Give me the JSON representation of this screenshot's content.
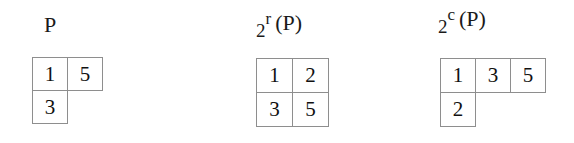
{
  "figure": {
    "background_color": "#ffffff",
    "border_color": "#8e8e8e",
    "text_color": "#1a1a1a"
  },
  "diagrams": [
    {
      "id": "p",
      "label": {
        "base": "P",
        "base_low": "",
        "superscript": "",
        "argument": ""
      },
      "shape": [
        2,
        1
      ],
      "rows": [
        [
          "1",
          "5"
        ],
        [
          "3"
        ]
      ]
    },
    {
      "id": "row",
      "label": {
        "base": "",
        "base_low": "2",
        "superscript": "r",
        "argument": "(P)"
      },
      "shape": [
        2,
        2
      ],
      "rows": [
        [
          "1",
          "2"
        ],
        [
          "3",
          "5"
        ]
      ]
    },
    {
      "id": "col",
      "label": {
        "base": "",
        "base_low": "2",
        "superscript": "c",
        "argument": "(P)"
      },
      "shape": [
        3,
        1
      ],
      "rows": [
        [
          "1",
          "3",
          "5"
        ],
        [
          "2"
        ]
      ]
    }
  ]
}
